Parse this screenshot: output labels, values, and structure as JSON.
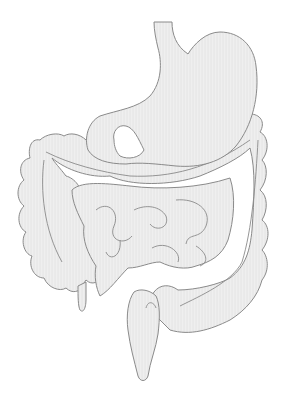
{
  "image": {
    "subject": "Human digestive system illustration",
    "parts": [
      "esophagus",
      "stomach",
      "large-intestine",
      "small-intestine",
      "appendix",
      "rectum"
    ],
    "colors": {
      "background": "#ffffff",
      "fill": "#ededed",
      "outline": "#8a8a8a"
    }
  }
}
